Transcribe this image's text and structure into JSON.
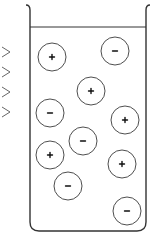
{
  "diagram": {
    "type": "electrolyte-solution-beaker",
    "colors": {
      "line": "#333333",
      "background": "#ffffff"
    },
    "beaker": {
      "left_x": 30,
      "right_x": 146,
      "top_y": 5,
      "bottom_y": 231,
      "liquid_level_y": 27
    },
    "side_markers": {
      "shape": "chevron",
      "count": 4,
      "y_positions": [
        52,
        72,
        92,
        112
      ]
    },
    "ions": [
      {
        "charge": "+",
        "cx": 52,
        "cy": 57
      },
      {
        "charge": "-",
        "cx": 115,
        "cy": 51
      },
      {
        "charge": "+",
        "cx": 91,
        "cy": 91
      },
      {
        "charge": "-",
        "cx": 50,
        "cy": 113
      },
      {
        "charge": "+",
        "cx": 125,
        "cy": 120
      },
      {
        "charge": "-",
        "cx": 83,
        "cy": 141
      },
      {
        "charge": "+",
        "cx": 50,
        "cy": 155
      },
      {
        "charge": "+",
        "cx": 122,
        "cy": 164
      },
      {
        "charge": "-",
        "cx": 68,
        "cy": 186
      },
      {
        "charge": "-",
        "cx": 127,
        "cy": 211
      }
    ],
    "ion_radius": 14,
    "counts": {
      "positive": 5,
      "negative": 5
    }
  }
}
